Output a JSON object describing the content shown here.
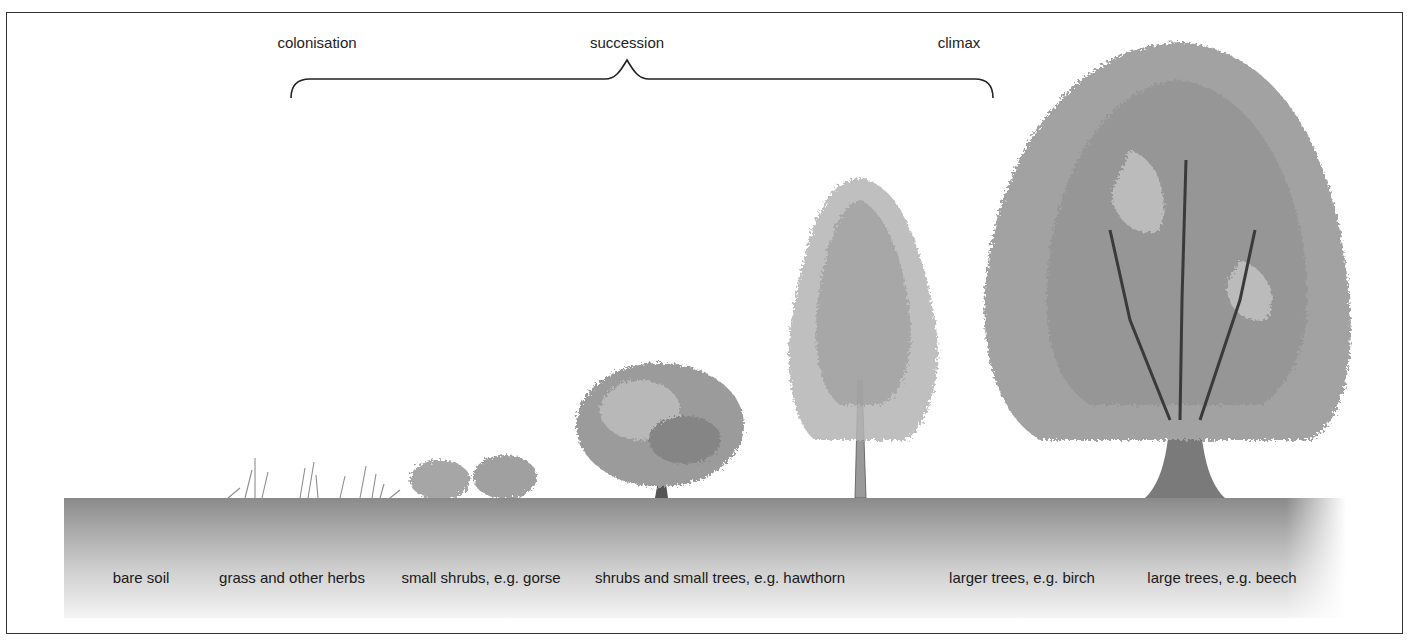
{
  "diagram": {
    "stages_top": [
      {
        "label": "colonisation",
        "x": 317
      },
      {
        "label": "succession",
        "x": 627
      },
      {
        "label": "climax",
        "x": 959
      }
    ],
    "ground_labels": [
      {
        "label": "bare soil",
        "x": 141
      },
      {
        "label": "grass and other herbs",
        "x": 292
      },
      {
        "label": "small shrubs, e.g. gorse",
        "x": 481
      },
      {
        "label": "shrubs and small trees, e.g. hawthorn",
        "x": 720
      },
      {
        "label": "larger trees, e.g. birch",
        "x": 1022
      },
      {
        "label": "large trees, e.g. beech",
        "x": 1222
      }
    ],
    "plants": [
      {
        "name": "grass-and-herbs",
        "stage": "grass and other herbs"
      },
      {
        "name": "gorse-shrubs",
        "stage": "small shrubs, e.g. gorse"
      },
      {
        "name": "hawthorn-tree",
        "stage": "shrubs and small trees, e.g. hawthorn"
      },
      {
        "name": "birch-tree",
        "stage": "larger trees, e.g. birch"
      },
      {
        "name": "beech-tree",
        "stage": "large trees, e.g. beech"
      }
    ],
    "colors": {
      "ink": "#222222",
      "ground_dark": "#8a8a8a",
      "foliage": "#9a9a9a"
    }
  }
}
